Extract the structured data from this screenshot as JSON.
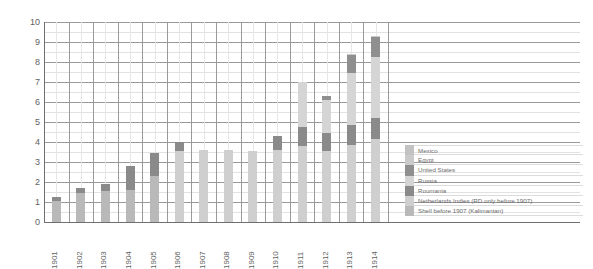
{
  "chart_data": {
    "type": "bar",
    "stacked": true,
    "title": "",
    "subtitle": "",
    "xlabel": "",
    "ylabel": "",
    "ylim": [
      0,
      10
    ],
    "yticks": [
      0,
      1,
      2,
      3,
      4,
      5,
      6,
      7,
      8,
      9,
      10
    ],
    "ytick_labels": [
      "0",
      "1",
      "2",
      "3",
      "4",
      "5",
      "6",
      "7",
      "8",
      "9",
      "10"
    ],
    "grid": true,
    "minor_grid": true,
    "legend_position": "bottom-right",
    "categories": [
      "1901",
      "1902",
      "1903",
      "1904",
      "1905",
      "1906",
      "1907",
      "1908",
      "1909",
      "1910",
      "1911",
      "1912",
      "1913",
      "1914"
    ],
    "series": [
      {
        "name": "Shell before 1907 (Kalimantan)",
        "color": "#b9b9b9",
        "values": [
          1.05,
          1.45,
          1.55,
          1.6,
          2.3,
          0.0,
          0.0,
          0.0,
          0.0,
          0.0,
          0.0,
          0.0,
          0.0,
          0.0
        ]
      },
      {
        "name": "Netherlands Indies (RD only before 1907)",
        "color": "#cfcfcf",
        "values": [
          0.0,
          0.0,
          0.0,
          0.0,
          0.0,
          3.55,
          3.6,
          3.6,
          3.55,
          3.6,
          3.8,
          3.55,
          3.85,
          4.15
        ]
      },
      {
        "name": "Roumania",
        "color": "#8a8a8a",
        "values": [
          0.2,
          0.25,
          0.35,
          1.2,
          1.15,
          0.45,
          0.0,
          0.0,
          0.0,
          0.7,
          0.95,
          0.9,
          1.0,
          1.05
        ]
      },
      {
        "name": "Russia",
        "color": "#d5d5d5",
        "values": [
          0.0,
          0.0,
          0.0,
          0.0,
          0.0,
          0.0,
          0.0,
          0.0,
          0.0,
          0.0,
          2.25,
          1.65,
          2.6,
          3.05
        ]
      },
      {
        "name": "United States",
        "color": "#8f8f8f",
        "values": [
          0.0,
          0.0,
          0.0,
          0.0,
          0.0,
          0.0,
          0.0,
          0.0,
          0.0,
          0.0,
          0.0,
          0.2,
          0.9,
          1.0
        ]
      },
      {
        "name": "Egypt",
        "color": "#cacaca",
        "values": [
          0.0,
          0.0,
          0.0,
          0.0,
          0.0,
          0.0,
          0.0,
          0.0,
          0.0,
          0.0,
          0.0,
          0.0,
          0.05,
          0.05
        ]
      },
      {
        "name": "Mexico",
        "color": "#c2c2c2",
        "values": [
          0.0,
          0.0,
          0.0,
          0.0,
          0.0,
          0.0,
          0.0,
          0.0,
          0.0,
          0.0,
          0.0,
          0.0,
          0.0,
          0.0
        ]
      }
    ],
    "totals": [
      1.25,
      1.7,
      1.9,
      2.8,
      3.45,
      4.0,
      3.6,
      3.6,
      3.55,
      4.3,
      7.0,
      6.3,
      8.4,
      9.3
    ]
  },
  "legend": {
    "items": [
      {
        "label": "Mexico",
        "color": "#c2c2c2"
      },
      {
        "label": "Egypt",
        "color": "#cacaca"
      },
      {
        "label": "United States",
        "color": "#8f8f8f"
      },
      {
        "label": "Russia",
        "color": "#d5d5d5"
      },
      {
        "label": "Roumania",
        "color": "#8a8a8a"
      },
      {
        "label": "Netherlands Indies (RD only before 1907)",
        "color": "#cfcfcf"
      },
      {
        "label": "Shell before 1907 (Kalimantan)",
        "color": "#b9b9b9"
      }
    ]
  },
  "colors": {
    "grid_major": "#9a9a9a",
    "grid_minor": "#e2e2e2",
    "axis": "#6f6f6f",
    "text": "#5f5f5f",
    "background": "#ffffff"
  }
}
